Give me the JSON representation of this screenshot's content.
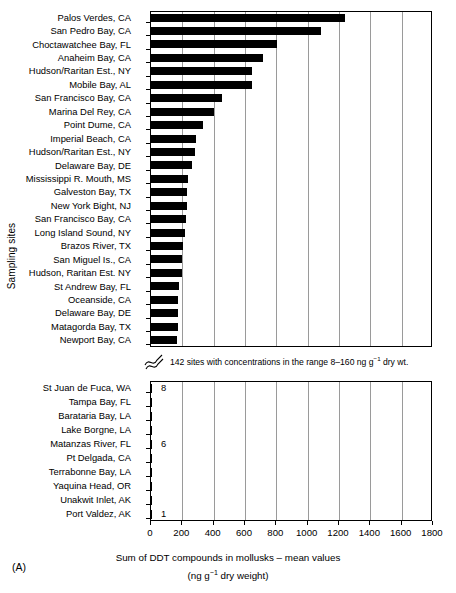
{
  "figure": {
    "panel_letter": "(A)",
    "ylabel": "Sampling sites",
    "xlabel_line1": "Sum of DDT compounds in mollusks – mean values",
    "xlabel_line2_pre": "(ng g",
    "xlabel_line2_sup": "−1",
    "xlabel_line2_post": " dry weight)",
    "break_note_pre": "142 sites with concentrations in the range 8–160 ng g",
    "break_note_sup": "−1",
    "break_note_post": " dry wt.",
    "break_icon": "axis-break-icon"
  },
  "chart_data": {
    "type": "bar",
    "orientation": "horizontal",
    "title": "Sum of DDT compounds in mollusks – mean values",
    "xlabel": "Sum of DDT compounds in mollusks – mean values (ng g⁻¹ dry weight)",
    "ylabel": "Sampling sites",
    "xlim": [
      0,
      1800
    ],
    "xticks": [
      0,
      200,
      400,
      600,
      800,
      1000,
      1200,
      1400,
      1600,
      1800
    ],
    "grid": true,
    "legend": null,
    "axis_break": {
      "between_groups": true,
      "note": "142 sites with concentrations in the range 8–160 ng g⁻¹ dry wt."
    },
    "groups": [
      {
        "name": "top-panel",
        "categories": [
          "Palos Verdes, CA",
          "San Pedro Bay, CA",
          "Choctawatchee Bay, FL",
          "Anaheim Bay, CA",
          "Hudson/Raritan Est., NY",
          "Mobile Bay, AL",
          "San Francisco Bay, CA",
          "Marina Del Rey, CA",
          "Point Dume, CA",
          "Imperial Beach, CA",
          "Hudson/Raritan Est., NY",
          "Delaware Bay, DE",
          "Mississippi R. Mouth, MS",
          "Galveston Bay, TX",
          "New York Bight, NJ",
          "San Francisco Bay, CA",
          "Long Island Sound, NY",
          "Brazos River, TX",
          "San Miguel Is., CA",
          "Hudson, Raritan Est. NY",
          "St Andrew Bay, FL",
          "Oceanside, CA",
          "Delaware Bay, DE",
          "Matagorda Bay, TX",
          "Newport Bay, CA"
        ],
        "values": [
          1240,
          1085,
          805,
          715,
          645,
          645,
          450,
          400,
          330,
          290,
          280,
          260,
          235,
          230,
          230,
          225,
          220,
          205,
          200,
          200,
          180,
          175,
          170,
          170,
          165
        ]
      },
      {
        "name": "bottom-panel",
        "categories": [
          "St Juan de Fuca, WA",
          "Tampa Bay, FL",
          "Barataria Bay, LA",
          "Lake Borgne, LA",
          "Matanzas River, FL",
          "Pt Delgada, CA",
          "Terrabonne Bay, LA",
          "Yaquina Head, OR",
          "Unakwit Inlet, AK",
          "Port Valdez, AK"
        ],
        "values": [
          8,
          7,
          7,
          7,
          6,
          5,
          4,
          3,
          2,
          1
        ],
        "value_labels": [
          "8",
          "",
          "",
          "",
          "6",
          "",
          "",
          "",
          "",
          "1"
        ]
      }
    ]
  }
}
